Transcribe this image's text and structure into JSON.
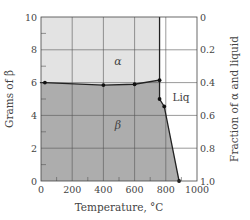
{
  "chart_data": {
    "type": "area",
    "title": "",
    "xlabel": "Temperature, °C",
    "ylabel_left": "Grams of β",
    "ylabel_right": "Fraction of α and liquid",
    "xlim": [
      0,
      1000
    ],
    "ylim_left": [
      0,
      10
    ],
    "ylim_right": [
      1.0,
      0
    ],
    "x_ticks": [
      0,
      200,
      400,
      600,
      800,
      1000
    ],
    "y_left_ticks": [
      0,
      2,
      4,
      6,
      8,
      10
    ],
    "y_right_ticks": [
      "0",
      "0.2",
      "0.4",
      "0.6",
      "0.8",
      "1.0"
    ],
    "grid": true,
    "regions": [
      {
        "label": "α",
        "color": "#e3e3e3"
      },
      {
        "label": "β",
        "color": "#adadad"
      },
      {
        "label": "Liq",
        "color": "#ffffff"
      }
    ],
    "series": [
      {
        "name": "Grams of β",
        "x": [
          25,
          400,
          600,
          760,
          760,
          790,
          885
        ],
        "y": [
          6.0,
          5.85,
          5.9,
          6.15,
          5.0,
          4.55,
          0.0
        ]
      }
    ],
    "phase_boundary_x": 760,
    "annotations": [
      "α",
      "β",
      "Liq"
    ]
  }
}
